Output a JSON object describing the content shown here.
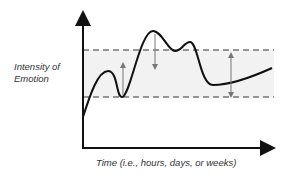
{
  "diagram": {
    "y_axis_label_line1": "Intensity of",
    "y_axis_label_line2": "Emotion",
    "x_axis_label": "Time (i.e., hours, days, or weeks)",
    "colors": {
      "axis": "#111111",
      "curve": "#111111",
      "dashed_bounds": "#333333",
      "band_fill": "#f2f2f2",
      "arrow": "#777777"
    },
    "elements": {
      "upper_bound": "dashed upper boundary line",
      "lower_bound": "dashed lower boundary line",
      "band": "shaded normal range band",
      "curve": "emotion intensity curve fluctuating over time",
      "arrows": [
        "upward arrow returning to band",
        "downward arrow returning to band",
        "double-headed arrow spanning band"
      ]
    }
  }
}
